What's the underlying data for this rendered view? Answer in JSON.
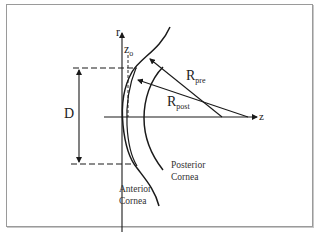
{
  "diagram": {
    "axes": {
      "r_label": "r",
      "z_label": "z"
    },
    "labels": {
      "z0": {
        "main": "z",
        "sub": "o"
      },
      "D": "D",
      "R_pre": {
        "main": "R",
        "sub": "pre"
      },
      "R_post": {
        "main": "R",
        "sub": "post"
      },
      "posterior": [
        "Posterior",
        "Cornea"
      ],
      "anterior": [
        "Anterior",
        "Cornea"
      ]
    },
    "colors": {
      "stroke": "#1a1a1a",
      "frame": "#9a9a9a",
      "background": "#ffffff"
    }
  }
}
